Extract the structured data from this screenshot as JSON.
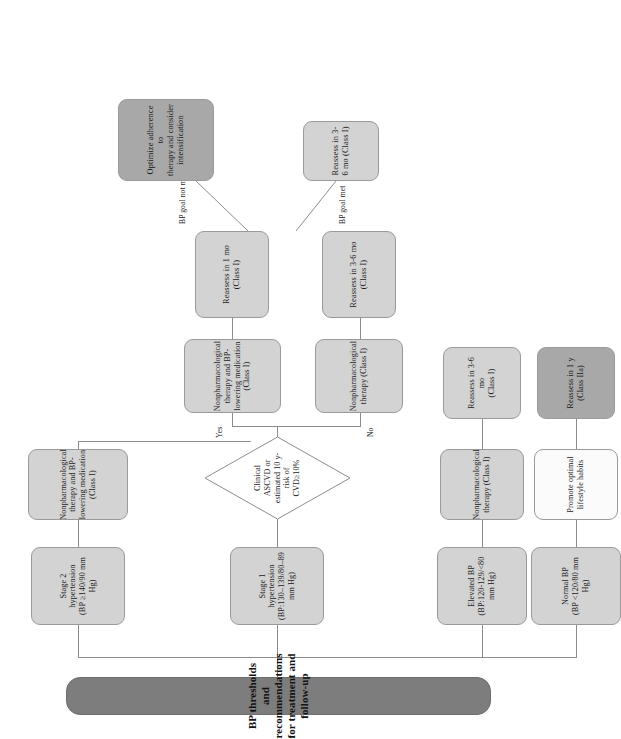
{
  "figure": {
    "title": "BP thresholds and recommendations for treatment and follow-up",
    "orientation": "rotated-90-ccw",
    "colors": {
      "title_fill": "#7d7d7d",
      "node_fill": "#d3d3d3",
      "emphasis_fill": "#a8a8a8",
      "plain_fill": "#fbfbfb",
      "line": "#8c8c8c",
      "text": "#1a1a1a"
    }
  },
  "nodes": {
    "title": "BP thresholds and recommendations for treatment and follow-up",
    "stage2": "Stage 2 hypertension\n(BP ≥140/90 mm Hg)",
    "stage2_l1": "Stage 2 hypertension",
    "stage2_l2": "(BP ≥140/90 mm",
    "stage2_l3": "Hg)",
    "stage2_rx_l1": "Nonpharmacological",
    "stage2_rx_l2": "therapy and BP-",
    "stage2_rx_l3": "lowering medication",
    "stage2_rx_l4": "(Class I)",
    "stage1_l1": "Stage 1 hypertension",
    "stage1_l2": "(BP:130–139/80–89",
    "stage1_l3": "mm Hg)",
    "decision_l1": "Clinical ASCVD or",
    "decision_l2": "estimated 10 y-risk of",
    "decision_l3": "CVD≥10%",
    "yes_rx_l1": "Nonpharmacological",
    "yes_rx_l2": "therapy and BP-",
    "yes_rx_l3": "lowering  medication",
    "yes_rx_l4": "(Class I)",
    "no_rx_l1": "Nonpharmacological",
    "no_rx_l2": "therapy (Class I)",
    "reassess_1mo_l1": "Reassess in 1 mo",
    "reassess_1mo_l2": "(Class I)",
    "reassess_36mo_mid_l1": "Reassess in 3-6 mo",
    "reassess_36mo_mid_l2": "(Class I)",
    "optimize_l1": "Optimize adherence to",
    "optimize_l2": "therapy and consider",
    "optimize_l3": "intensification",
    "reassess_36mo_right_l1": "Reassess in 3-",
    "reassess_36mo_right_l2": "6 mo (Class I)",
    "elevated_l1": "Elevated BP",
    "elevated_l2": "(BP:120-129/<80",
    "elevated_l3": "mm Hg)",
    "elevated_rx_l1": "Nonpharmacological",
    "elevated_rx_l2": "therapy (Class I)",
    "elevated_fu_l1": "Reassess in 3-6 mo",
    "elevated_fu_l2": "(Class I)",
    "normal_l1": "Normal BP",
    "normal_l2": "(BP <120/80 mm",
    "normal_l3": "Hg)",
    "normal_rx_l1": "Promote optimal",
    "normal_rx_l2": "lifestyle habits",
    "normal_fu_l1": "Reassess in 1 y",
    "normal_fu_l2": "(Class IIa)"
  },
  "edge_labels": {
    "yes": "Yes",
    "no": "No",
    "bp_goal_not_met": "BP goal not met",
    "bp_goal_met": "BP goal met"
  }
}
